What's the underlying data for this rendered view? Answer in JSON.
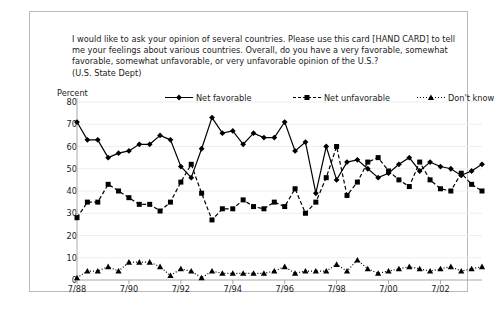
{
  "question": "I would like to ask your opinion of several countries.  Please use this card [HAND CARD] to tell\nme your feelings about various countries.  Overall, do you have a very favorable, somewhat\nfavorable, somewhat unfavorable, or very unfavorable opinion of the U.S.?\n(U.S. State Dept)",
  "axis_title": "Percent",
  "legend": [
    {
      "label": "Net favorable",
      "style": "solid",
      "marker": "diamond",
      "color": "#000000"
    },
    {
      "label": "Net unfavorable",
      "style": "dashed",
      "marker": "square",
      "color": "#000000"
    },
    {
      "label": "Don't know",
      "style": "dotted",
      "marker": "triangle",
      "color": "#000000"
    }
  ],
  "chart_data": {
    "type": "line",
    "title": "",
    "subtitle": "",
    "xlabel": "",
    "ylabel": "Percent",
    "ylim": [
      0,
      80
    ],
    "ytick_labels": [
      "0",
      "10",
      "20",
      "30",
      "40",
      "50",
      "60",
      "70",
      "80"
    ],
    "yticks": [
      0,
      10,
      20,
      30,
      40,
      50,
      60,
      70,
      80
    ],
    "xtick_labels": [
      "7/88",
      "7/90",
      "7/92",
      "7/94",
      "7/96",
      "7/98",
      "7/00",
      "7/02"
    ],
    "xtick_index": [
      0,
      5,
      10,
      15,
      20,
      25,
      30,
      35
    ],
    "grid": "horizontal",
    "legend_position": "top",
    "n_points": 40,
    "series": [
      {
        "name": "Net favorable",
        "values": [
          71,
          63,
          63,
          55,
          57,
          58,
          61,
          61,
          65,
          63,
          51,
          46,
          59,
          73,
          66,
          67,
          61,
          66,
          64,
          64,
          71,
          58,
          62,
          39,
          60,
          45,
          53,
          54,
          50,
          46,
          48,
          52,
          55,
          49,
          53,
          51,
          50,
          47,
          49,
          52
        ]
      },
      {
        "name": "Net unfavorable",
        "values": [
          28,
          35,
          35,
          43,
          40,
          37,
          34,
          34,
          31,
          35,
          44,
          52,
          39,
          27,
          32,
          32,
          36,
          33,
          32,
          35,
          33,
          41,
          30,
          35,
          46,
          60,
          38,
          44,
          53,
          55,
          49,
          45,
          42,
          53,
          45,
          41,
          40,
          48,
          43,
          40
        ]
      },
      {
        "name": "Don't know",
        "values": [
          1,
          4,
          4,
          6,
          4,
          8,
          8,
          8,
          6,
          2,
          5,
          4,
          1,
          4,
          3,
          3,
          3,
          3,
          3,
          4,
          6,
          3,
          4,
          4,
          4,
          7,
          4,
          9,
          5,
          3,
          4,
          5,
          6,
          5,
          4,
          5,
          6,
          4,
          5,
          6
        ]
      }
    ]
  }
}
